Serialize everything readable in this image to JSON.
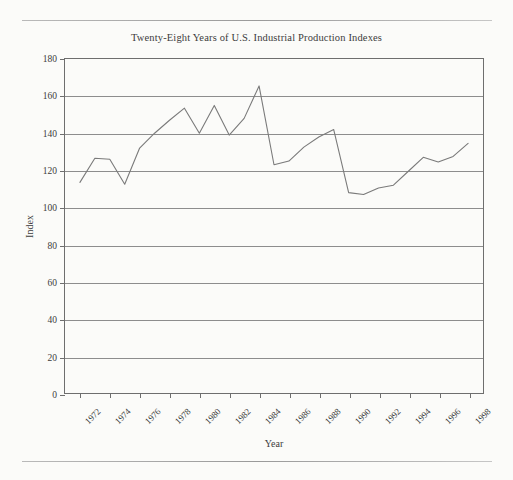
{
  "page": {
    "rule_top": "horizontal-rule",
    "rule_bottom": "horizontal-rule"
  },
  "figure": {
    "title": "Twenty-Eight Years of U.S. Industrial Production Indexes",
    "x_axis_title": "Year",
    "y_axis_title": "Index",
    "line_color": "#7a7a7a",
    "grid_color": "#8d8d8d",
    "frame_color": "#6e6e6e"
  },
  "chart_data": {
    "type": "line",
    "title": "Twenty-Eight Years of U.S. Industrial Production Indexes",
    "xlabel": "Year",
    "ylabel": "Index",
    "xlim": [
      1971,
      1999
    ],
    "ylim": [
      0,
      180
    ],
    "y_ticks": [
      0,
      20,
      40,
      60,
      80,
      100,
      120,
      140,
      160,
      180
    ],
    "x_ticks": [
      1972,
      1974,
      1976,
      1978,
      1980,
      1982,
      1984,
      1986,
      1988,
      1990,
      1992,
      1994,
      1996,
      1998
    ],
    "x_tick_labels": [
      "1972",
      "1974",
      "1976",
      "1978",
      "1980",
      "1982",
      "1984",
      "1986",
      "1988",
      "1990",
      "1992",
      "1994",
      "1996",
      "1998"
    ],
    "grid": "horizontal",
    "legend": "none",
    "x": [
      1972,
      1973,
      1974,
      1975,
      1976,
      1977,
      1978,
      1979,
      1980,
      1981,
      1982,
      1983,
      1984,
      1985,
      1986,
      1987,
      1988,
      1989,
      1990,
      1991,
      1992,
      1993,
      1994,
      1995,
      1996,
      1997,
      1998
    ],
    "series": [
      {
        "name": "U.S. Industrial Production Index",
        "values": [
          113.5,
          126.5,
          126.0,
          112.5,
          132.0,
          140.0,
          147.0,
          153.5,
          140.0,
          155.0,
          139.0,
          148.0,
          165.5,
          123.0,
          125.0,
          132.5,
          138.0,
          142.0,
          108.0,
          107.0,
          110.5,
          112.0,
          119.5,
          127.0,
          124.5,
          127.5,
          134.5
        ]
      }
    ]
  }
}
